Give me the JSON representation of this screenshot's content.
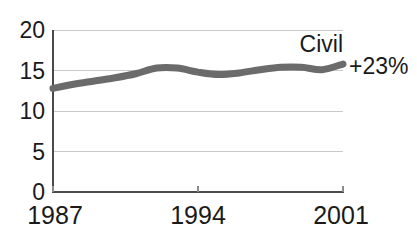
{
  "chart_data": {
    "type": "line",
    "title": "",
    "xlabel": "",
    "ylabel": "",
    "xlim": [
      1987,
      2001
    ],
    "ylim": [
      0,
      20
    ],
    "grid": true,
    "legend_position": "top-right-inline",
    "x_tick_labels": [
      "1987",
      "1994",
      "2001"
    ],
    "x_tick_values": [
      1987,
      1994,
      2001
    ],
    "y_tick_labels": [
      "0",
      "5",
      "10",
      "15",
      "20"
    ],
    "y_tick_values": [
      0,
      5,
      10,
      15,
      20
    ],
    "series": [
      {
        "name": "Civil",
        "color": "#6b6b6b",
        "end_label": "+23%",
        "x": [
          1987,
          1988,
          1989,
          1990,
          1991,
          1992,
          1993,
          1994,
          1995,
          1996,
          1997,
          1998,
          1999,
          2000,
          2001
        ],
        "values": [
          12.8,
          13.3,
          13.7,
          14.1,
          14.6,
          15.3,
          15.3,
          14.8,
          14.5,
          14.7,
          15.1,
          15.4,
          15.4,
          15.1,
          15.8
        ]
      }
    ],
    "annotations": [
      {
        "name": "series-name",
        "text": "Civil"
      },
      {
        "name": "percent-change",
        "text": "+23%"
      }
    ]
  },
  "axis": {
    "y_labels": [
      "20",
      "15",
      "10",
      "5",
      "0"
    ],
    "x_labels": [
      "1987",
      "1994",
      "2001"
    ]
  },
  "labels": {
    "series_name": "Civil",
    "percent_change": "+23%"
  },
  "colors": {
    "line": "#6b6b6b",
    "grid": "#c9c9c9",
    "axis": "#4a4a4a",
    "text": "#1a1a1a",
    "background": "#ffffff"
  }
}
